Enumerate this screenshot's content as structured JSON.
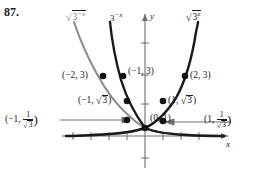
{
  "problem": {
    "number": "87."
  },
  "axes": {
    "x_label": "x",
    "y_label": "y",
    "x_axis_y": 136,
    "y_axis_x": 145,
    "unit_px": 28,
    "x_ticks": [
      -4,
      -3,
      -2,
      -1,
      1,
      2,
      3
    ],
    "y_ticks": [
      1,
      2,
      3,
      4,
      -1
    ]
  },
  "curves": [
    {
      "name": "sqrt-3-neg-x",
      "expr": "3^-x",
      "radical": true,
      "exponent": "−x",
      "color": "#8c8c8c",
      "label_text": "√(3^−x)"
    },
    {
      "name": "3-neg-x",
      "expr": "3^-x",
      "radical": false,
      "exponent": "−x",
      "color": "#1a1a1a",
      "label_text": "3^−x"
    },
    {
      "name": "sqrt-3-x",
      "expr": "3^x",
      "radical": true,
      "exponent": "x",
      "color": "#1a1a1a",
      "label_text": "√(3^x)"
    }
  ],
  "curve_labels": {
    "left": {
      "base": "3",
      "exp": "−x",
      "radical": true,
      "color": "#8c8c8c"
    },
    "middle": {
      "base": "3",
      "exp": "−x",
      "radical": false,
      "color": "#1a1a1a"
    },
    "right": {
      "base": "3",
      "exp": "x",
      "radical": true,
      "color": "#1a1a1a"
    }
  },
  "points": [
    {
      "id": "p-neg2-3",
      "label": "(−2, 3)",
      "x": -2,
      "y": 3,
      "align": "right"
    },
    {
      "id": "p-neg1-3",
      "label": "(−1, 3)",
      "x": -1,
      "y": 3,
      "align": "left"
    },
    {
      "id": "p-2-3",
      "label": "(2, 3)",
      "x": 2,
      "y": 3,
      "align": "left"
    },
    {
      "id": "p-neg1-sqrt3",
      "label": "(−1, √3)",
      "x": -1,
      "y": 1.732,
      "align": "right"
    },
    {
      "id": "p-1-sqrt3",
      "label": "(1, √3)",
      "x": 1,
      "y": 1.732,
      "align": "left"
    },
    {
      "id": "p-0-1",
      "label": "(0, 1)",
      "x": 0,
      "y": 1,
      "align": "left"
    },
    {
      "id": "p-neg1-inv",
      "label": "(−1, 1/√3)",
      "x": -1,
      "y": 0.577,
      "align": "far-left"
    },
    {
      "id": "p-1-inv",
      "label": "(1, 1/√3)",
      "x": 1,
      "y": 0.577,
      "align": "far-right"
    }
  ],
  "point_labels": {
    "neg2_3": "(−2, 3)",
    "neg1_3": "(−1, 3)",
    "two_3": "(2, 3)",
    "zero_1": "(0, 1)",
    "neg1_sqrt3_pre": "(−1, ",
    "neg1_sqrt3_rad": "3",
    "neg1_sqrt3_post": ")",
    "one_sqrt3_pre": "(1, ",
    "one_sqrt3_rad": "3",
    "one_sqrt3_post": ")",
    "neg1_frac_pre": "(−1, ",
    "neg1_frac_num": "1",
    "neg1_frac_den": "3",
    "neg1_frac_post": ")",
    "one_frac_pre": "(1, ",
    "one_frac_num": "1",
    "one_frac_den": "3",
    "one_frac_post": ")"
  },
  "colors": {
    "gray_curve": "#8c8c8c",
    "black_curve": "#1a1a1a",
    "axis": "#6e6e6e",
    "text": "#1a1a1a",
    "background": "#ffffff"
  }
}
